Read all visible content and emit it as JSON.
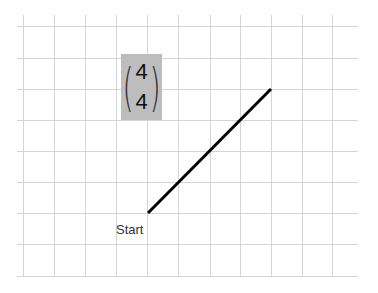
{
  "diagram": {
    "grid": {
      "x_lines": [
        23,
        54,
        85,
        116,
        147,
        178,
        210,
        240,
        271,
        302,
        332
      ],
      "y_lines": [
        26,
        58,
        89,
        120,
        151,
        182,
        213,
        244,
        276
      ],
      "extent": {
        "x1": 17,
        "x2": 358,
        "y1": 15,
        "y2": 277
      },
      "color": "#d4d4d4"
    },
    "vector": {
      "components": [
        "4",
        "4"
      ],
      "box_color": "#bdbdbd",
      "left_paren": "(",
      "right_paren": ")"
    },
    "segment": {
      "start": {
        "x": 148,
        "y": 213
      },
      "end": {
        "x": 271,
        "y": 89
      },
      "color": "#000000",
      "width": 3
    },
    "start_label": "Start"
  }
}
